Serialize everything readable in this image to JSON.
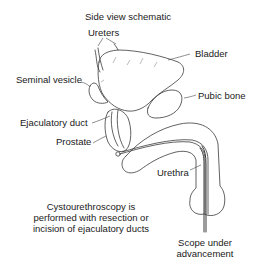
{
  "title": "Side view schematic",
  "labels": {
    "ureters": "Ureters",
    "bladder": "Bladder",
    "seminal_vesicle": "Seminal vesicle",
    "pubic_bone": "Pubic bone",
    "ejaculatory_duct": "Ejaculatory duct",
    "prostate": "Prostate",
    "urethra": "Urethra"
  },
  "caption": {
    "line1": "Cystourethroscopy is",
    "line2": "performed with resection or",
    "line3": "incision of ejaculatory ducts"
  },
  "scope_label": {
    "line1": "Scope under",
    "line2": "advancement"
  }
}
